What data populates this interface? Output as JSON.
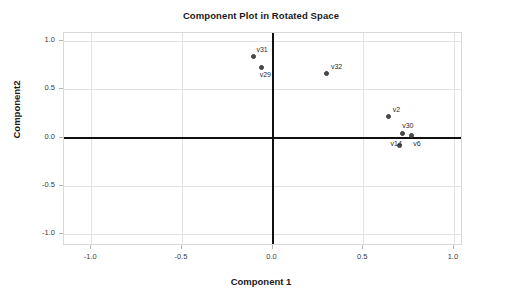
{
  "chart_data": {
    "type": "scatter",
    "title": "Component Plot in Rotated Space",
    "xlabel": "Component 1",
    "ylabel": "Component2",
    "xlim": [
      -1.15,
      1.05
    ],
    "ylim": [
      -1.12,
      1.08
    ],
    "grid": true,
    "legend": "none",
    "xticks": [
      "-1.0",
      "-0.5",
      "0.0",
      "0.5",
      "1.0"
    ],
    "xtick_values": [
      -1.0,
      -0.5,
      0.0,
      0.5,
      1.0
    ],
    "yticks": [
      "1.0",
      "0.5",
      "0.0",
      "-0.5",
      "-1.0"
    ],
    "ytick_values": [
      1.0,
      0.5,
      0.0,
      -0.5,
      -1.0
    ],
    "points": [
      {
        "label": "v31",
        "x": -0.1,
        "y": 0.83,
        "label_dx": 2,
        "label_dy": -11
      },
      {
        "label": "v29",
        "x": -0.06,
        "y": 0.72,
        "label_dx": -2,
        "label_dy": 3
      },
      {
        "label": "v32",
        "x": 0.3,
        "y": 0.66,
        "label_dx": 4,
        "label_dy": -11
      },
      {
        "label": "v2",
        "x": 0.64,
        "y": 0.21,
        "label_dx": 4,
        "label_dy": -11
      },
      {
        "label": "v30",
        "x": 0.72,
        "y": 0.04,
        "label_dx": -1,
        "label_dy": -12
      },
      {
        "label": "v6",
        "x": 0.77,
        "y": 0.02,
        "label_dx": 1,
        "label_dy": 4
      },
      {
        "label": "v14",
        "x": 0.7,
        "y": -0.09,
        "label_dx": -9,
        "label_dy": -6
      }
    ]
  }
}
